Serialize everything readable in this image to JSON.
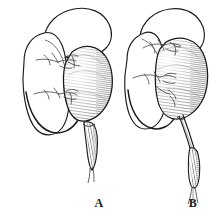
{
  "figure": {
    "kind": "anatomical-line-engraving",
    "background_color": "#ffffff",
    "ink_color": "#1a1a1a",
    "hatch_color": "#4a4a4a",
    "vessel_color": "#555555",
    "panels": [
      {
        "id": "A",
        "label": "A",
        "label_position": {
          "x": 89,
          "y": 196
        },
        "description": "bilobed outlined organ with hatched ovoid body on right side and short thick descending cord",
        "parts": [
          {
            "name": "upper-lobe-outline",
            "shading": "none"
          },
          {
            "name": "lower-lobe-outline",
            "shading": "none"
          },
          {
            "name": "hatched-ovoid-body",
            "shading": "fine-parallel-hatching"
          },
          {
            "name": "branching-vessels-upper",
            "shading": "thin-line"
          },
          {
            "name": "branching-vessels-lower",
            "shading": "thin-line"
          },
          {
            "name": "descending-cord",
            "shading": "cross-hatched",
            "length": "short"
          }
        ]
      },
      {
        "id": "B",
        "label": "B",
        "label_position": {
          "x": 183,
          "y": 196
        },
        "description": "bilobed outlined organ with hatched ovoid body on right side and long thin descending cord ending in small hatched bulb",
        "parts": [
          {
            "name": "upper-lobe-outline",
            "shading": "none"
          },
          {
            "name": "lower-lobe-outline",
            "shading": "none"
          },
          {
            "name": "hatched-ovoid-body",
            "shading": "fine-parallel-hatching"
          },
          {
            "name": "branching-vessels-upper",
            "shading": "thin-line"
          },
          {
            "name": "branching-vessels-lower",
            "shading": "thin-line"
          },
          {
            "name": "descending-cord",
            "shading": "thin-line",
            "length": "long"
          },
          {
            "name": "terminal-bulb",
            "shading": "cross-hatched"
          }
        ]
      }
    ]
  }
}
